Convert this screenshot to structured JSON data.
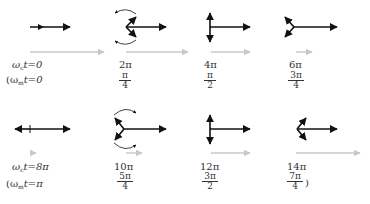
{
  "figure": {
    "colors": {
      "phasor": "#111111",
      "resultant": "#c8c8c8"
    },
    "row1": {
      "prefix_carrier": "ω",
      "prefix_carrier_sub": "c",
      "prefix_carrier_rest": "t=0",
      "prefix_mod_open": "(ω",
      "prefix_mod_sub": "m",
      "prefix_mod_rest": "t=0",
      "columns": [
        {
          "carrier": "",
          "mod_num": "",
          "mod_den": ""
        },
        {
          "carrier": "2π",
          "mod_num": "π",
          "mod_den": "4"
        },
        {
          "carrier": "4π",
          "mod_num": "π",
          "mod_den": "2"
        },
        {
          "carrier": "6π",
          "mod_num": "3π",
          "mod_den": "4"
        }
      ]
    },
    "row2": {
      "prefix_carrier": "ω",
      "prefix_carrier_sub": "c",
      "prefix_carrier_rest": "t=8π",
      "prefix_mod_open": "(ω",
      "prefix_mod_sub": "m",
      "prefix_mod_rest": "t=π",
      "columns": [
        {
          "carrier": "",
          "mod_num": "",
          "mod_den": ""
        },
        {
          "carrier": "10π",
          "mod_num": "5π",
          "mod_den": "4"
        },
        {
          "carrier": "12π",
          "mod_num": "3π",
          "mod_den": "2"
        },
        {
          "carrier": "14π",
          "mod_num": "7π",
          "mod_den": "4"
        }
      ],
      "close_paren": ")"
    }
  }
}
